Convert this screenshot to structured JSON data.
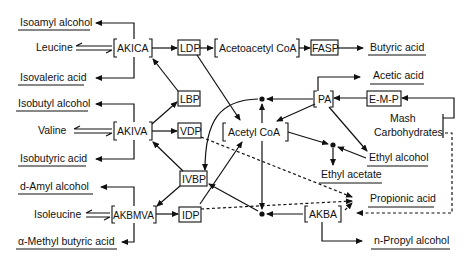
{
  "diagram": {
    "type": "metabolic-pathway",
    "amino_acids": {
      "leucine": "Leucine",
      "valine": "Valine",
      "isoleucine": "Isoleucine"
    },
    "keto_acids": {
      "akica": "AKICA",
      "akiva": "AKIVA",
      "akbmva": "AKBMVA",
      "akba": "AKBA",
      "pa": "PA"
    },
    "intermediates": {
      "acetoacetyl_coa": "Acetoacetyl CoA",
      "acetyl_coa": "Acetyl CoA"
    },
    "pathways": {
      "ldp": "LDP",
      "lbp": "LBP",
      "vdp": "VDP",
      "ivbp": "IVBP",
      "idp": "IDP",
      "fasp": "FASP",
      "emp": "E-M-P"
    },
    "products": {
      "isoamyl_alcohol": "Isoamyl alcohol",
      "isovaleric_acid": "Isovaleric acid",
      "isobutyl_alcohol": "Isobutyl alcohol",
      "isobutyric_acid": "Isobutyric acid",
      "d_amyl_alcohol": "d-Amyl alcohol",
      "alpha_methyl_butyric_acid": "α-Methyl butyric acid",
      "butyric_acid": "Butyric acid",
      "acetic_acid": "Acetic acid",
      "ethyl_alcohol": "Ethyl alcohol",
      "ethyl_acetate": "Ethyl acetate",
      "propionic_acid": "Propionic acid",
      "n_propyl_alcohol": "n-Propyl alcohol"
    },
    "source": {
      "line1": "Mash",
      "line2": "Carbohydrates"
    }
  }
}
